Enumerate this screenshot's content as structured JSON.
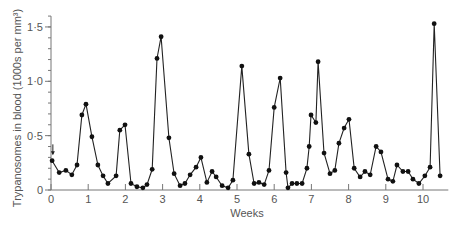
{
  "chart_data": {
    "type": "line",
    "title": "",
    "xlabel": "Weeks",
    "ylabel": "Trypanosomes in blood (1000s per mm³)",
    "xlim": [
      0,
      10.6
    ],
    "ylim": [
      0,
      1.6
    ],
    "x_ticks": [
      0,
      1,
      2,
      3,
      4,
      5,
      6,
      7,
      8,
      9,
      10
    ],
    "x_tick_labels": [
      "0",
      "1",
      "2",
      "3",
      "4",
      "5",
      "6",
      "7",
      "8",
      "9",
      "10"
    ],
    "y_ticks": [
      0,
      0.5,
      1.0,
      1.5
    ],
    "y_tick_labels": [
      "0",
      "0·5",
      "1·0",
      "1·5"
    ],
    "y_minor_step": 0.1,
    "grid": false,
    "legend": null,
    "annotations": [
      {
        "type": "arrow-down",
        "x": 0.05,
        "y_from": 0.42,
        "y_to": 0.33
      }
    ],
    "series": [
      {
        "name": "Trypanosome count",
        "marker": "circle",
        "x": [
          0.03,
          0.22,
          0.4,
          0.56,
          0.7,
          0.83,
          0.94,
          1.1,
          1.26,
          1.4,
          1.53,
          1.75,
          1.85,
          1.99,
          2.15,
          2.31,
          2.47,
          2.58,
          2.72,
          2.85,
          2.96,
          3.17,
          3.31,
          3.47,
          3.6,
          3.74,
          3.9,
          4.03,
          4.19,
          4.33,
          4.44,
          4.6,
          4.76,
          4.89,
          5.13,
          5.32,
          5.46,
          5.59,
          5.73,
          5.86,
          6.0,
          6.16,
          6.32,
          6.37,
          6.48,
          6.61,
          6.75,
          6.88,
          6.94,
          6.99,
          7.12,
          7.18,
          7.34,
          7.5,
          7.63,
          7.74,
          7.88,
          8.01,
          8.15,
          8.31,
          8.44,
          8.58,
          8.74,
          8.87,
          9.06,
          9.19,
          9.3,
          9.46,
          9.6,
          9.73,
          9.89,
          10.05,
          10.19,
          10.3,
          10.46
        ],
        "values": [
          0.27,
          0.16,
          0.18,
          0.14,
          0.23,
          0.69,
          0.79,
          0.49,
          0.23,
          0.13,
          0.06,
          0.13,
          0.55,
          0.6,
          0.06,
          0.03,
          0.02,
          0.05,
          0.19,
          1.21,
          1.41,
          0.48,
          0.15,
          0.04,
          0.06,
          0.14,
          0.21,
          0.3,
          0.07,
          0.17,
          0.12,
          0.04,
          0.02,
          0.09,
          1.14,
          0.33,
          0.06,
          0.07,
          0.05,
          0.18,
          0.76,
          1.03,
          0.16,
          0.02,
          0.06,
          0.06,
          0.06,
          0.2,
          0.4,
          0.69,
          0.62,
          1.18,
          0.34,
          0.15,
          0.18,
          0.43,
          0.57,
          0.65,
          0.2,
          0.12,
          0.17,
          0.14,
          0.4,
          0.35,
          0.1,
          0.08,
          0.23,
          0.17,
          0.17,
          0.1,
          0.06,
          0.13,
          0.21,
          1.53,
          0.13
        ]
      }
    ]
  }
}
